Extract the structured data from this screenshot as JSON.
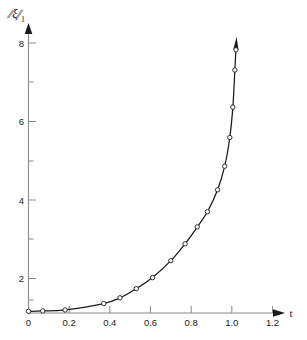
{
  "chart_data": {
    "type": "line",
    "title": "",
    "xlabel": "t",
    "ylabel": "‖ξ‖₁",
    "ylabel_parts": {
      "bar_left": "∕∕",
      "symbol": "ξ",
      "bar_right": "∕∕",
      "subscript": "1"
    },
    "xlim": [
      0,
      1.2
    ],
    "ylim": [
      0,
      8.6
    ],
    "grid": false,
    "legend": null,
    "xticks": [
      0,
      0.2,
      0.4,
      0.6,
      0.8,
      1.0,
      1.2
    ],
    "xtick_labels": [
      "0",
      "0.2",
      "0.4",
      "0.6",
      "0.8",
      "1.0",
      "1.2"
    ],
    "yticks": [
      2,
      4,
      6,
      8
    ],
    "ytick_labels": [
      "2",
      "4",
      "6",
      "8"
    ],
    "yticks_minor": [
      1,
      3,
      5,
      7
    ],
    "series": [
      {
        "name": "blowup-solution",
        "marker": "open-circle",
        "line_color": "#1a1a1a",
        "terminal_arrow": true,
        "x": [
          0.0,
          0.07,
          0.18,
          0.37,
          0.45,
          0.53,
          0.61,
          0.7,
          0.77,
          0.83,
          0.88,
          0.93,
          0.965,
          0.99,
          1.005,
          1.015,
          1.02
        ],
        "y": [
          0.05,
          0.06,
          0.09,
          0.28,
          0.45,
          0.72,
          1.05,
          1.55,
          2.05,
          2.55,
          3.0,
          3.65,
          4.35,
          5.2,
          6.1,
          7.2,
          7.8
        ]
      }
    ],
    "annotations": [
      {
        "name": "y-axis-arrowhead",
        "at": [
          0,
          8.6
        ]
      },
      {
        "name": "x-axis-arrowhead",
        "at": [
          1.26,
          0
        ]
      },
      {
        "name": "curve-blowup-arrowhead",
        "at": [
          1.02,
          8.0
        ]
      }
    ]
  },
  "axis_labels": {
    "x_name": "t",
    "y_name": "‖ξ‖₁"
  },
  "colors": {
    "curve": "#1a1a1a",
    "axis": "#8a8a8a",
    "text": "#1a1a1a",
    "background": "#ffffff",
    "marker_fill": "#ffffff"
  }
}
